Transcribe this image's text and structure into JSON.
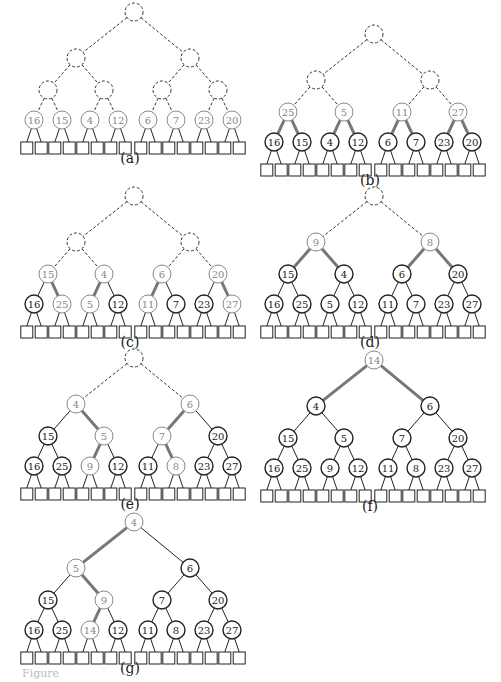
{
  "figure": {
    "footer_text": "Figure"
  },
  "colors": {
    "ink": "#222222",
    "highlight": "#777777",
    "highlight_text": "#888888",
    "dashed": "#333333"
  },
  "panels": [
    {
      "id": "a",
      "label": "(a)",
      "left": 14,
      "top": 4,
      "nodes": [
        "",
        "",
        "",
        "",
        "",
        "",
        "",
        "16",
        "15",
        "4",
        "12",
        "6",
        "7",
        "23",
        "20"
      ],
      "state": [
        "d",
        "d",
        "d",
        "d",
        "d",
        "d",
        "d",
        "g",
        "g",
        "g",
        "g",
        "g",
        "g",
        "g",
        "g"
      ],
      "thick": []
    },
    {
      "id": "b",
      "label": "(b)",
      "left": 254,
      "top": 26,
      "nodes": [
        "",
        "",
        "",
        "25",
        "5",
        "11",
        "27",
        "16",
        "15",
        "4",
        "12",
        "6",
        "7",
        "23",
        "20"
      ],
      "state": [
        "d",
        "d",
        "d",
        "g",
        "g",
        "g",
        "g",
        "n",
        "n",
        "n",
        "n",
        "n",
        "n",
        "n",
        "n"
      ],
      "thick": [
        7,
        8,
        9,
        10,
        11,
        12,
        13,
        14
      ]
    },
    {
      "id": "c",
      "label": "(c)",
      "left": 14,
      "top": 188,
      "nodes": [
        "",
        "",
        "",
        "15",
        "4",
        "6",
        "20",
        "16",
        "25",
        "5",
        "12",
        "11",
        "7",
        "23",
        "27"
      ],
      "state": [
        "d",
        "d",
        "d",
        "g",
        "g",
        "g",
        "g",
        "n",
        "g",
        "g",
        "n",
        "g",
        "n",
        "n",
        "g"
      ],
      "thick": [
        8,
        9,
        11,
        14
      ]
    },
    {
      "id": "d",
      "label": "(d)",
      "left": 254,
      "top": 188,
      "nodes": [
        "",
        "9",
        "8",
        "15",
        "4",
        "6",
        "20",
        "16",
        "25",
        "5",
        "12",
        "11",
        "7",
        "23",
        "27"
      ],
      "state": [
        "d",
        "g",
        "g",
        "n",
        "n",
        "n",
        "n",
        "n",
        "n",
        "n",
        "n",
        "n",
        "n",
        "n",
        "n"
      ],
      "thick": [
        3,
        4,
        5,
        6
      ]
    },
    {
      "id": "e",
      "label": "(e)",
      "left": 14,
      "top": 350,
      "nodes": [
        "",
        "4",
        "6",
        "15",
        "5",
        "7",
        "20",
        "16",
        "25",
        "9",
        "12",
        "11",
        "8",
        "23",
        "27"
      ],
      "state": [
        "d",
        "g",
        "g",
        "n",
        "g",
        "g",
        "n",
        "n",
        "n",
        "g",
        "n",
        "n",
        "g",
        "n",
        "n"
      ],
      "thick": [
        4,
        5,
        9,
        12
      ]
    },
    {
      "id": "f",
      "label": "(f)",
      "left": 254,
      "top": 352,
      "nodes": [
        "14",
        "4",
        "6",
        "15",
        "5",
        "7",
        "20",
        "16",
        "25",
        "9",
        "12",
        "11",
        "8",
        "23",
        "27"
      ],
      "state": [
        "g",
        "n",
        "n",
        "n",
        "n",
        "n",
        "n",
        "n",
        "n",
        "n",
        "n",
        "n",
        "n",
        "n",
        "n"
      ],
      "thick": [
        1,
        2
      ]
    },
    {
      "id": "g",
      "label": "(g)",
      "left": 14,
      "top": 514,
      "nodes": [
        "4",
        "5",
        "6",
        "15",
        "9",
        "7",
        "20",
        "16",
        "25",
        "14",
        "12",
        "11",
        "8",
        "23",
        "27"
      ],
      "state": [
        "g",
        "g",
        "n",
        "n",
        "g",
        "n",
        "n",
        "n",
        "n",
        "g",
        "n",
        "n",
        "n",
        "n",
        "n"
      ],
      "thick": [
        1,
        4,
        9
      ]
    }
  ]
}
